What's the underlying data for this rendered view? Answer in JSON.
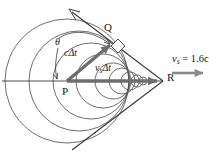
{
  "figure": {
    "type": "physics-diagram",
    "background_color": "#ffffff",
    "line_color": "#3a3a3a",
    "wavefront_color": "#555555",
    "vector_color": "#6e6e6e",
    "text_color": "#1a1a1a"
  },
  "labels": {
    "point_p": "P",
    "point_q": "Q",
    "point_r": "R",
    "vector_c_dt": "cΔt",
    "vector_vs_dt": "v",
    "vector_vs_dt_sub": "s",
    "vector_vs_dt_tail": "Δt",
    "angle_theta": "θ",
    "speed_symbol": "v",
    "speed_subscript": "s",
    "speed_equals": " = 1.6c"
  },
  "chart_data": {
    "type": "scatter",
    "title": "",
    "xlabel": "",
    "ylabel": "",
    "grid": false,
    "legend": null,
    "axis_line": {
      "orientation": "horizontal",
      "x_start": 2,
      "x_end": 163,
      "y": 81
    },
    "points": [
      {
        "name": "P",
        "x": 67,
        "y": 81,
        "role": "source-origin"
      },
      {
        "name": "Q",
        "x": 113,
        "y": 42,
        "role": "wavefront-tangent-point"
      },
      {
        "name": "R",
        "x": 163,
        "y": 81,
        "role": "current-source-position"
      }
    ],
    "vectors": [
      {
        "name": "c-delta-t",
        "from": "P",
        "to": "Q",
        "label": "cΔt"
      },
      {
        "name": "vs-delta-t",
        "from": "P",
        "to": "R",
        "label": "v_sΔt"
      }
    ],
    "wavefronts": [
      {
        "cx": 67,
        "cy": 81,
        "r": 62
      },
      {
        "cx": 79,
        "cy": 81,
        "r": 50
      },
      {
        "cx": 91,
        "cy": 81,
        "r": 38
      },
      {
        "cx": 103,
        "cy": 81,
        "r": 27
      },
      {
        "cx": 113,
        "cy": 81,
        "r": 18
      },
      {
        "cx": 122,
        "cy": 81,
        "r": 13
      },
      {
        "cx": 130,
        "cy": 81,
        "r": 9
      },
      {
        "cx": 137,
        "cy": 81,
        "r": 6
      },
      {
        "cx": 143,
        "cy": 81,
        "r": 4
      }
    ],
    "mach_cone": {
      "apex": {
        "x": 163,
        "y": 81
      },
      "upper_edge_end": {
        "x": 72,
        "y": 12
      },
      "lower_edge_end": {
        "x": 72,
        "y": 150
      },
      "half_angle_deg": 39
    },
    "right_angle_marker": {
      "x": 113,
      "y": 42,
      "size": 9
    },
    "annotations": [
      {
        "text": "θ",
        "x": 58,
        "y": 42,
        "kind": "angle-label"
      },
      {
        "text": "cΔt",
        "x": 71,
        "y": 53,
        "kind": "vector-label"
      },
      {
        "text": "v_sΔt",
        "x": 99,
        "y": 68,
        "kind": "vector-label"
      },
      {
        "text": "v_s = 1.6c",
        "x": 172,
        "y": 60,
        "kind": "speed-label"
      },
      {
        "text": "P",
        "x": 64,
        "y": 91,
        "kind": "point-label"
      },
      {
        "text": "Q",
        "x": 106,
        "y": 28,
        "kind": "point-label"
      },
      {
        "text": "R",
        "x": 168,
        "y": 78,
        "kind": "point-label"
      }
    ],
    "speed_arrow": {
      "x_start": 172,
      "x_end": 208,
      "y": 73,
      "direction": "right"
    }
  }
}
